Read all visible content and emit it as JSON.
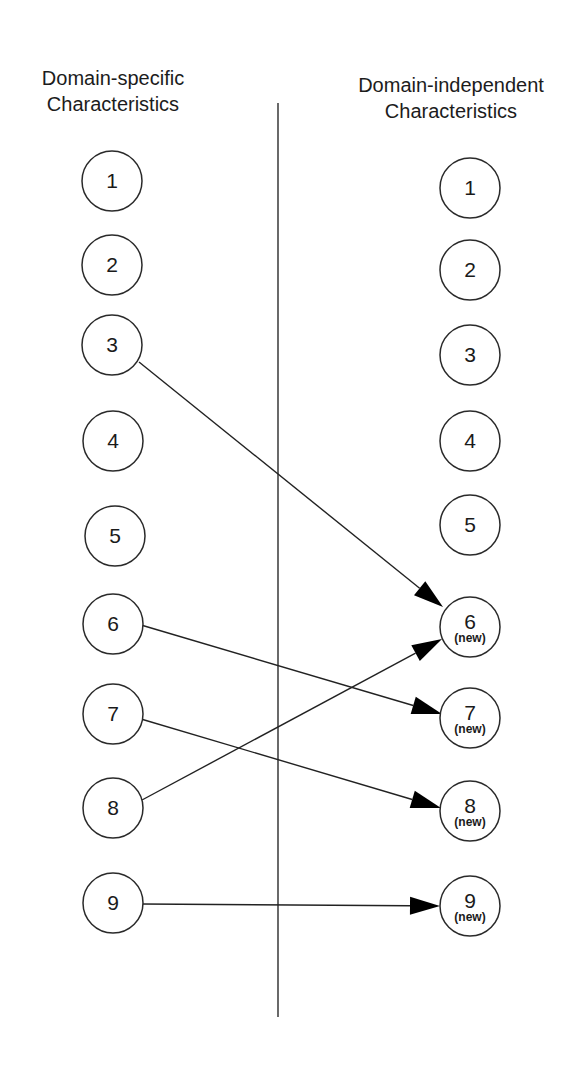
{
  "headings": {
    "left": [
      "Domain-specific",
      "Characteristics"
    ],
    "right": [
      "Domain-independent",
      "Characteristics"
    ]
  },
  "divider": {
    "x": 278,
    "y1": 103,
    "y2": 1017
  },
  "node_radius": 30,
  "left_nodes": [
    {
      "id": "L1",
      "label": "1",
      "x": 112,
      "y": 181
    },
    {
      "id": "L2",
      "label": "2",
      "x": 112,
      "y": 265
    },
    {
      "id": "L3",
      "label": "3",
      "x": 112,
      "y": 345
    },
    {
      "id": "L4",
      "label": "4",
      "x": 113,
      "y": 441
    },
    {
      "id": "L5",
      "label": "5",
      "x": 115,
      "y": 536
    },
    {
      "id": "L6",
      "label": "6",
      "x": 113,
      "y": 624
    },
    {
      "id": "L7",
      "label": "7",
      "x": 113,
      "y": 714
    },
    {
      "id": "L8",
      "label": "8",
      "x": 113,
      "y": 808
    },
    {
      "id": "L9",
      "label": "9",
      "x": 113,
      "y": 903
    }
  ],
  "right_nodes": [
    {
      "id": "R1",
      "label": "1",
      "tag": "",
      "x": 470,
      "y": 188
    },
    {
      "id": "R2",
      "label": "2",
      "tag": "",
      "x": 470,
      "y": 270
    },
    {
      "id": "R3",
      "label": "3",
      "tag": "",
      "x": 470,
      "y": 355
    },
    {
      "id": "R4",
      "label": "4",
      "tag": "",
      "x": 470,
      "y": 441
    },
    {
      "id": "R5",
      "label": "5",
      "tag": "",
      "x": 470,
      "y": 525
    },
    {
      "id": "R6",
      "label": "6",
      "tag": "(new)",
      "x": 470,
      "y": 627
    },
    {
      "id": "R7",
      "label": "7",
      "tag": "(new)",
      "x": 470,
      "y": 718
    },
    {
      "id": "R8",
      "label": "8",
      "tag": "(new)",
      "x": 470,
      "y": 811
    },
    {
      "id": "R9",
      "label": "9",
      "tag": "(new)",
      "x": 470,
      "y": 906
    }
  ],
  "edges": [
    {
      "from": "L3",
      "to": "R6",
      "x1": 139,
      "y1": 362,
      "x2": 443,
      "y2": 607
    },
    {
      "from": "L6",
      "to": "R7",
      "x1": 141,
      "y1": 625,
      "x2": 442,
      "y2": 714
    },
    {
      "from": "L7",
      "to": "R8",
      "x1": 141,
      "y1": 719,
      "x2": 441,
      "y2": 808
    },
    {
      "from": "L8",
      "to": "R6",
      "x1": 142,
      "y1": 800,
      "x2": 442,
      "y2": 639
    },
    {
      "from": "L9",
      "to": "R9",
      "x1": 142,
      "y1": 904,
      "x2": 440,
      "y2": 906
    }
  ]
}
